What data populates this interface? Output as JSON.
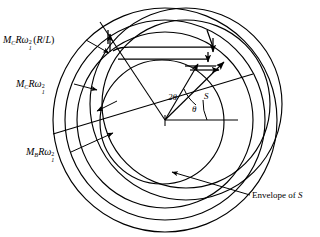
{
  "figure": {
    "background": "#ffffff",
    "stroke": "#000000",
    "width": 320,
    "height": 237
  },
  "labels": {
    "mc_rl": {
      "text": "M_C R ω₁² (R/L)",
      "symbol_m": "M",
      "sub_c": "C",
      "symbol_r": "R",
      "symbol_omega": "ω",
      "omega_sup": "2",
      "omega_sub": "1",
      "paren": "(R/L)"
    },
    "mc": {
      "text": "M_C R ω₁²",
      "symbol_m": "M",
      "sub_c": "C",
      "symbol_r": "R",
      "symbol_omega": "ω",
      "omega_sup": "2",
      "omega_sub": "1"
    },
    "mb": {
      "text": "M_B R ω₁²",
      "symbol_m": "M",
      "sub_b": "B",
      "symbol_r": "R",
      "symbol_omega": "ω",
      "omega_sup": "2",
      "omega_sub": "1"
    },
    "envelope": "Envelope of",
    "envelope_symbol": "S",
    "angle_two_theta": "2θ",
    "angle_theta": "θ",
    "vector_s": "S"
  },
  "geometry": {
    "center": {
      "x": 165,
      "y": 120
    },
    "circles": [
      {
        "name": "outer-boundary-circle",
        "cx": 165,
        "cy": 120,
        "r": 112
      },
      {
        "name": "second-circle",
        "cx": 165,
        "cy": 120,
        "r": 100
      },
      {
        "name": "third-circle",
        "cx": 165,
        "cy": 120,
        "r": 88
      },
      {
        "name": "inner-circle",
        "cx": 162,
        "cy": 122,
        "r": 62
      }
    ],
    "offset_circles": [
      {
        "name": "offset-envelope-large",
        "cx": 186,
        "cy": 104,
        "r": 96
      },
      {
        "name": "offset-envelope-mid",
        "cx": 186,
        "cy": 104,
        "r": 84
      }
    ],
    "radial_lines": [
      {
        "name": "radial-line-upper-left",
        "angle_deg": 108
      },
      {
        "name": "radial-line-s-vector",
        "angle_deg": 46
      },
      {
        "name": "radial-line-baseline",
        "angle_deg": 0
      },
      {
        "name": "radial-line-long-lower-left",
        "angle_deg": 197
      }
    ],
    "angles": {
      "theta_deg": 30,
      "two_theta_deg": 62
    }
  },
  "annotations": {
    "leader_lines": [
      {
        "name": "leader-mc-rl",
        "from": [
          86,
          40
        ],
        "to": [
          108,
          52
        ]
      },
      {
        "name": "leader-mc",
        "from": [
          76,
          84
        ],
        "to": [
          96,
          90
        ]
      },
      {
        "name": "leader-inner",
        "from": [
          114,
          102
        ],
        "to": [
          96,
          111
        ]
      },
      {
        "name": "leader-mb",
        "from": [
          72,
          152
        ],
        "to": [
          110,
          133
        ]
      },
      {
        "name": "leader-envelope",
        "from": [
          250,
          196
        ],
        "to": [
          173,
          173
        ]
      }
    ]
  }
}
